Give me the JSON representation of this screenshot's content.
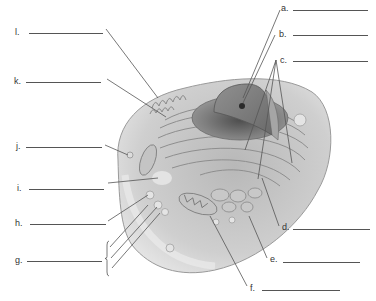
{
  "diagram": {
    "labels": [
      {
        "id": "a",
        "text": "a.",
        "x": 281,
        "y": 4,
        "blank": {
          "x1": 293,
          "x2": 368,
          "y": 10
        }
      },
      {
        "id": "b",
        "text": "b.",
        "x": 279,
        "y": 30,
        "blank": {
          "x1": 293,
          "x2": 368,
          "y": 35
        }
      },
      {
        "id": "c",
        "text": "c.",
        "x": 280,
        "y": 56,
        "blank": {
          "x1": 293,
          "x2": 368,
          "y": 61
        }
      },
      {
        "id": "d",
        "text": "d.",
        "x": 282,
        "y": 223,
        "blank": {
          "x1": 293,
          "x2": 370,
          "y": 229
        }
      },
      {
        "id": "e",
        "text": "e.",
        "x": 270,
        "y": 255,
        "blank": {
          "x1": 283,
          "x2": 360,
          "y": 262
        }
      },
      {
        "id": "f",
        "text": "f.",
        "x": 250,
        "y": 284,
        "blank": {
          "x1": 262,
          "x2": 340,
          "y": 290
        }
      },
      {
        "id": "l",
        "text": "l.",
        "x": 15,
        "y": 28,
        "blank": {
          "x1": 29,
          "x2": 103,
          "y": 33
        }
      },
      {
        "id": "k",
        "text": "k.",
        "x": 14,
        "y": 77,
        "blank": {
          "x1": 26,
          "x2": 101,
          "y": 82
        }
      },
      {
        "id": "j",
        "text": "j.",
        "x": 16,
        "y": 142,
        "blank": {
          "x1": 26,
          "x2": 102,
          "y": 147
        }
      },
      {
        "id": "i",
        "text": "i.",
        "x": 17,
        "y": 184,
        "blank": {
          "x1": 29,
          "x2": 104,
          "y": 189
        }
      },
      {
        "id": "h",
        "text": "h.",
        "x": 15,
        "y": 219,
        "blank": {
          "x1": 30,
          "x2": 106,
          "y": 224
        }
      },
      {
        "id": "g",
        "text": "g.",
        "x": 15,
        "y": 256,
        "blank": {
          "x1": 27,
          "x2": 102,
          "y": 261
        }
      }
    ],
    "leaders": [
      {
        "for": "a",
        "x1": 280,
        "y1": 10,
        "x2": 243,
        "y2": 98
      },
      {
        "for": "b",
        "x1": 275,
        "y1": 35,
        "x2": 243,
        "y2": 103
      },
      {
        "for": "c",
        "x1": 276,
        "y1": 60,
        "x2": 245,
        "y2": 150
      },
      {
        "for": "c",
        "x1": 276,
        "y1": 60,
        "x2": 292,
        "y2": 163
      },
      {
        "for": "c",
        "x1": 276,
        "y1": 60,
        "x2": 258,
        "y2": 179
      },
      {
        "for": "d",
        "x1": 279,
        "y1": 226,
        "x2": 262,
        "y2": 178
      },
      {
        "for": "e",
        "x1": 267,
        "y1": 258,
        "x2": 249,
        "y2": 216
      },
      {
        "for": "f",
        "x1": 247,
        "y1": 286,
        "x2": 210,
        "y2": 216
      },
      {
        "for": "l",
        "x1": 106,
        "y1": 29,
        "x2": 158,
        "y2": 98
      },
      {
        "for": "k",
        "x1": 107,
        "y1": 79,
        "x2": 166,
        "y2": 117
      },
      {
        "for": "j",
        "x1": 105,
        "y1": 145,
        "x2": 128,
        "y2": 155
      },
      {
        "for": "i",
        "x1": 108,
        "y1": 183,
        "x2": 158,
        "y2": 178
      },
      {
        "for": "h",
        "x1": 108,
        "y1": 221,
        "x2": 148,
        "y2": 195
      },
      {
        "for": "g",
        "x1": 110,
        "y1": 247,
        "x2": 148,
        "y2": 205
      },
      {
        "for": "g",
        "x1": 111,
        "y1": 258,
        "x2": 157,
        "y2": 207
      },
      {
        "for": "g",
        "x1": 112,
        "y1": 268,
        "x2": 160,
        "y2": 213
      }
    ],
    "brace": {
      "for": "g",
      "x": 107,
      "y1": 241,
      "y2": 276
    },
    "colors": {
      "text": "#333333",
      "line": "#555555",
      "cell_fill": "#d8d8d8",
      "cytoplasm": "#bdbdbd",
      "nucleus": "#8a8a8a",
      "er": "#a0a0a0"
    }
  }
}
